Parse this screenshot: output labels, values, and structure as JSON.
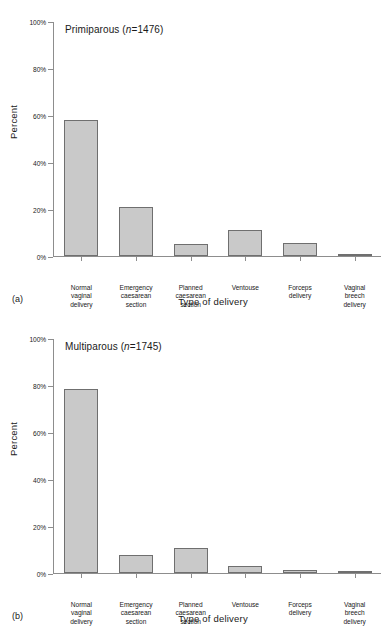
{
  "figure": {
    "panels": [
      {
        "tag": "(a)",
        "title_prefix": "Primiparous (",
        "title_italic": "n",
        "title_suffix": "=1476)",
        "ylabel": "Percent",
        "xlabel": "Type of delivery"
      },
      {
        "tag": "(b)",
        "title_prefix": "Multiparous (",
        "title_italic": "n",
        "title_suffix": "=1745)",
        "ylabel": "Percent",
        "xlabel": "Type of delivery"
      }
    ],
    "ytick_labels": [
      "0%",
      "20%",
      "40%",
      "60%",
      "80%",
      "100%"
    ],
    "categories": [
      [
        "Normal",
        "vaginal",
        "delivery"
      ],
      [
        "Emergency",
        "caesarean",
        "section"
      ],
      [
        "Planned",
        "caesarean",
        "section"
      ],
      [
        "Ventouse"
      ],
      [
        "Forceps",
        "delivery"
      ],
      [
        "Vaginal",
        "breech",
        "delivery"
      ]
    ],
    "bar_fill": "#c9c9c9",
    "bar_stroke": "#6f6f6f",
    "axis_color": "#8d8d8d"
  },
  "chart_data": [
    {
      "type": "bar",
      "title": "Primiparous (n=1476)",
      "categories": [
        "Normal vaginal delivery",
        "Emergency caesarean section",
        "Planned caesarean section",
        "Ventouse",
        "Forceps delivery",
        "Vaginal breech delivery"
      ],
      "values": [
        58.0,
        20.9,
        5.0,
        11.2,
        5.5,
        0.8
      ],
      "xlabel": "Type of delivery",
      "ylabel": "Percent",
      "ylim": [
        0,
        100
      ],
      "yticks": [
        0,
        20,
        40,
        60,
        80,
        100
      ],
      "ytick_labels": [
        "0%",
        "20%",
        "40%",
        "60%",
        "80%",
        "100%"
      ],
      "grid": false,
      "legend": "none",
      "panel": "(a)"
    },
    {
      "type": "bar",
      "title": "Multiparous (n=1745)",
      "categories": [
        "Normal vaginal delivery",
        "Emergency caesarean section",
        "Planned caesarean section",
        "Ventouse",
        "Forceps delivery",
        "Vaginal breech delivery"
      ],
      "values": [
        78.7,
        7.5,
        10.7,
        3.1,
        1.2,
        0.9
      ],
      "xlabel": "Type of delivery",
      "ylabel": "Percent",
      "ylim": [
        0,
        100
      ],
      "yticks": [
        0,
        20,
        40,
        60,
        80,
        100
      ],
      "ytick_labels": [
        "0%",
        "20%",
        "40%",
        "60%",
        "80%",
        "100%"
      ],
      "grid": false,
      "legend": "none",
      "panel": "(b)"
    }
  ]
}
